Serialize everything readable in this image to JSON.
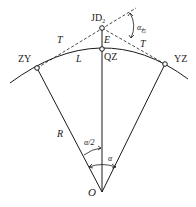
{
  "diagram": {
    "colors": {
      "line": "#1a1a1a",
      "background": "#ffffff"
    },
    "points": {
      "JD": {
        "label": "JD",
        "subscript": "2"
      },
      "QZ": {
        "label": "QZ"
      },
      "ZY": {
        "label": "ZY"
      },
      "YZ": {
        "label": "YZ"
      },
      "O": {
        "label": "O"
      }
    },
    "labels": {
      "tangent_left": "T",
      "tangent_right": "T",
      "external": "E",
      "length": "L",
      "radius": "R",
      "half_angle": "α/2",
      "angle": "α",
      "deflection": "α",
      "deflection_sub": "右"
    }
  }
}
